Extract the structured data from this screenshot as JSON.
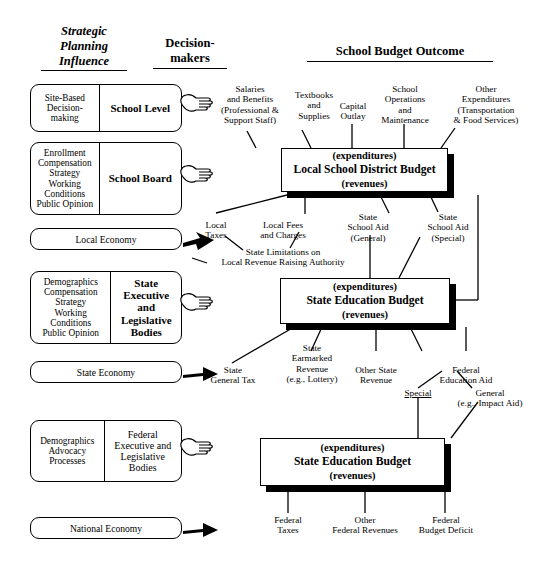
{
  "headings": {
    "strategic": [
      "Strategic",
      "Planning",
      "Influence"
    ],
    "decision": [
      "Decision-",
      "makers"
    ],
    "outcome": "School Budget Outcome"
  },
  "rows": [
    {
      "influence": [
        "Site-Based",
        "Decision-",
        "making"
      ],
      "decision_maker": [
        "School Level"
      ],
      "bold": true
    },
    {
      "influence": [
        "Enrollment",
        "Compensation",
        "Strategy",
        "Working",
        "Conditions",
        "Public Opinion"
      ],
      "decision_maker": [
        "School Board"
      ],
      "bold": true
    },
    {
      "influence": [
        "Demographics",
        "Compensation",
        "Strategy",
        "Working Conditions",
        "Public Opinion"
      ],
      "decision_maker": [
        "State",
        "Executive",
        "and",
        "Legislative",
        "Bodies"
      ],
      "bold": true
    },
    {
      "influence": [
        "Demographics",
        "Advocacy",
        "Processes"
      ],
      "decision_maker": [
        "Federal",
        "Executive and",
        "Legislative",
        "Bodies"
      ],
      "bold": false
    }
  ],
  "economies": [
    {
      "label": "Local Economy"
    },
    {
      "label": "State Economy"
    },
    {
      "label": "National Economy"
    }
  ],
  "budget_boxes": [
    {
      "top": "(expenditures)",
      "main": "Local School District Budget",
      "bottom": "(revenues)"
    },
    {
      "top": "(expenditures)",
      "main": "State Education Budget",
      "bottom": "(revenues)"
    },
    {
      "top": "(expenditures)",
      "main": "State Education Budget",
      "bottom": "(revenues)"
    }
  ],
  "labels": {
    "district_expenditures": [
      {
        "lines": [
          "Salaries",
          "and Benefits",
          "(Professional &",
          "Support Staff)"
        ]
      },
      {
        "lines": [
          "Textbooks",
          "and",
          "Supplies"
        ]
      },
      {
        "lines": [
          "Capital",
          "Outlay"
        ]
      },
      {
        "lines": [
          "School",
          "Operations",
          "and",
          "Maintenance"
        ]
      },
      {
        "lines": [
          "Other",
          "Expenditures",
          "(Transportation",
          "& Food Services)"
        ]
      }
    ],
    "district_revenues": [
      {
        "lines": [
          "Local",
          "Taxes"
        ]
      },
      {
        "lines": [
          "Local Fees",
          "and Charges"
        ]
      },
      {
        "lines": [
          "State",
          "School Aid",
          "(General)"
        ]
      },
      {
        "lines": [
          "State",
          "School Aid",
          "(Special)"
        ]
      }
    ],
    "state_limitation": {
      "lines": [
        "State Limitations on",
        "Local Revenue Raising Authority"
      ]
    },
    "state_revenues": [
      {
        "lines": [
          "State",
          "General Tax"
        ]
      },
      {
        "lines": [
          "State",
          "Earmarked",
          "Revenue",
          "(e.g., Lottery)"
        ]
      },
      {
        "lines": [
          "Other State",
          "Revenue"
        ]
      },
      {
        "lines": [
          "Federal",
          "Education Aid"
        ]
      }
    ],
    "federal_aid_kinds": [
      {
        "lines": [
          "Special"
        ],
        "underline": true
      },
      {
        "lines": [
          "General"
        ],
        "underline": true,
        "note": "(e.g., Impact Aid)"
      }
    ],
    "federal_revenues": [
      {
        "lines": [
          "Federal",
          "Taxes"
        ]
      },
      {
        "lines": [
          "Other",
          "Federal Revenues"
        ]
      },
      {
        "lines": [
          "Federal",
          "Budget Deficit"
        ]
      }
    ]
  },
  "icons": {
    "pointing_hand": "pointing-hand-icon",
    "arrow": "arrow-right-icon"
  },
  "colors": {
    "ink": "#000000",
    "paper": "#ffffff"
  }
}
